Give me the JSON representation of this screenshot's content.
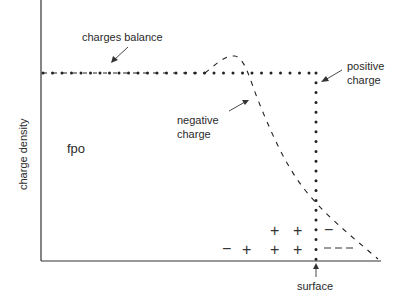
{
  "diagram": {
    "y_axis_label": "charge density",
    "placeholder_text": "fpo",
    "labels": {
      "charges_balance": "charges balance",
      "positive_charge_line1": "positive",
      "positive_charge_line2": "charge",
      "negative_charge_line1": "negative",
      "negative_charge_line2": "charge",
      "surface": "surface"
    },
    "symbols": {
      "plus": "+",
      "minus": "−"
    },
    "colors": {
      "line": "#333333",
      "text": "#2a2a2a",
      "background": "#ffffff"
    }
  }
}
